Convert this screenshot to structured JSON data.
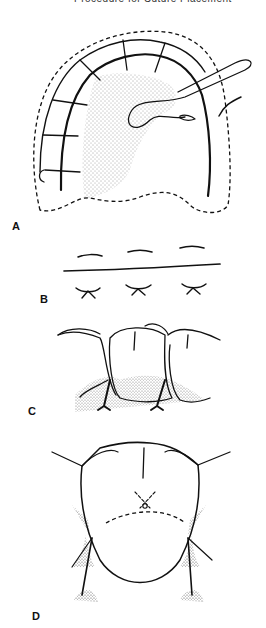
{
  "header": {
    "running_title": "Procedure for Suture Placement"
  },
  "figure": {
    "panels": [
      {
        "id": "A",
        "label": "A",
        "description": "Palatal view of arch with continuous sling sutures, dashed flap outline, shaded palatal area, and needle with suture loop"
      },
      {
        "id": "B",
        "label": "B",
        "description": "Schematic of interrupted sutures above and crossing knots below an incision line"
      },
      {
        "id": "C",
        "label": "C",
        "description": "Buccal view of teeth with interdental sutures at papillae, stippled gingiva"
      },
      {
        "id": "D",
        "label": "D",
        "description": "Occlusal view of tooth with suture knot, dashed incision line, and flap releasing incisions"
      }
    ]
  },
  "colors": {
    "ink": "#111111",
    "background": "#ffffff"
  }
}
